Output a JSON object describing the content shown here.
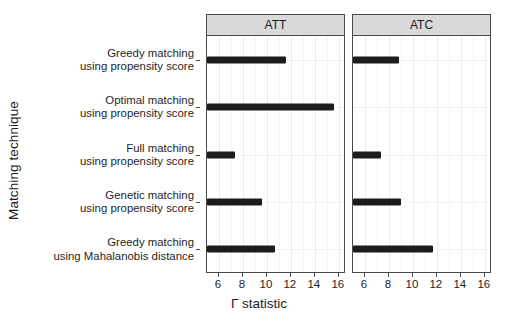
{
  "chart_data": {
    "type": "bar",
    "orientation": "horizontal",
    "title": "",
    "xlabel": "Γ statistic",
    "ylabel": "Matching technique",
    "xlim": [
      5.0,
      16.6
    ],
    "xticks": [
      6,
      8,
      10,
      12,
      14,
      16
    ],
    "xtick_labels": [
      "6",
      "8",
      "10",
      "12",
      "14",
      "16"
    ],
    "minor_xticks": [
      5,
      7,
      9,
      11,
      13,
      15,
      16
    ],
    "grid": true,
    "legend": "none",
    "facets": [
      "ATT",
      "ATC"
    ],
    "categories": [
      "Greedy matching using propensity score",
      "Optimal matching using propensity score",
      "Full matching using propensity score",
      "Genetic matching using propensity score",
      "Greedy matching using Mahalanobis distance"
    ],
    "category_lines": [
      [
        "Greedy matching",
        "using propensity score"
      ],
      [
        "Optimal matching",
        "using propensity score"
      ],
      [
        "Full matching",
        "using propensity score"
      ],
      [
        "Genetic matching",
        "using propensity score"
      ],
      [
        "Greedy matching",
        "using Mahalanobis distance"
      ]
    ],
    "series": [
      {
        "name": "ATT",
        "values": [
          11.6,
          15.6,
          7.3,
          9.6,
          10.7
        ]
      },
      {
        "name": "ATC",
        "values": [
          8.8,
          null,
          7.3,
          9.0,
          11.7
        ]
      }
    ],
    "bar_color": "#1c1c1c",
    "panel_strip_color": "#d9d9d9",
    "panel_border_color": "#4a4a4a",
    "background_color": "#ffffff"
  },
  "panels": [
    {
      "label": "ATT"
    },
    {
      "label": "ATC"
    }
  ],
  "axes": {
    "x_title": "Γ statistic",
    "y_title": "Matching technique"
  }
}
